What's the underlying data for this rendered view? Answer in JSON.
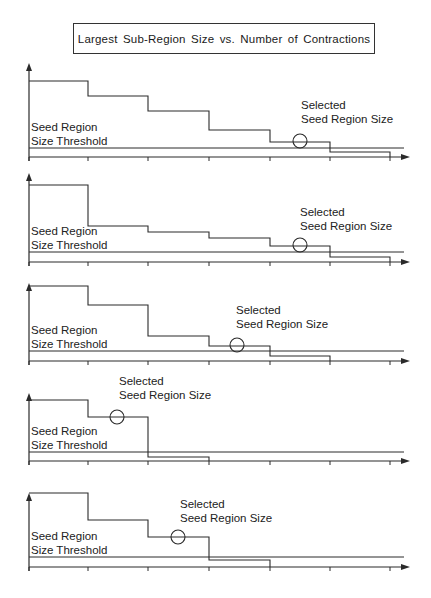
{
  "title": "Largest Sub-Region Size vs. Number of Contractions",
  "labels": {
    "threshold_line1": "Seed Region",
    "threshold_line2": "Size  Threshold",
    "selected_line1": "Selected",
    "selected_line2": "Seed Region Size"
  },
  "colors": {
    "line": "#2a2a2a",
    "background": "#ffffff"
  },
  "chart_data": {
    "type": "line",
    "title": "Largest Sub-Region Size vs. Number of Contractions",
    "xlabel": "Number of Contractions",
    "ylabel": "Largest Sub-Region Size",
    "x_ticks": [
      0,
      1,
      2,
      3,
      4,
      5,
      6
    ],
    "panels": [
      {
        "id": 1,
        "top": 60,
        "steps_y": [
          81,
          96,
          111,
          130,
          142,
          152
        ],
        "threshold_y": 148,
        "axis_y": 157,
        "selected_circle": {
          "x": 300,
          "y": 141
        },
        "selected_label": {
          "x": 301,
          "y": 122
        }
      },
      {
        "id": 2,
        "top": 170,
        "steps_y": [
          185,
          226,
          232,
          238,
          246,
          257
        ],
        "threshold_y": 252,
        "axis_y": 262,
        "selected_circle": {
          "x": 300,
          "y": 245
        },
        "selected_label": {
          "x": 300,
          "y": 229
        }
      },
      {
        "id": 3,
        "top": 280,
        "steps_y": [
          286,
          305,
          336,
          346,
          356
        ],
        "threshold_y": 351,
        "axis_y": 361,
        "selected_circle": {
          "x": 237,
          "y": 345
        },
        "selected_label": {
          "x": 236,
          "y": 327
        }
      },
      {
        "id": 4,
        "top": 390,
        "steps_y": [
          400,
          417,
          457
        ],
        "threshold_y": 452,
        "axis_y": 461,
        "selected_circle": {
          "x": 117,
          "y": 417
        },
        "selected_label": {
          "x": 119,
          "y": 398
        }
      },
      {
        "id": 5,
        "top": 490,
        "steps_y": [
          493,
          520,
          537,
          560
        ],
        "threshold_y": 557,
        "axis_y": 567,
        "selected_circle": {
          "x": 178,
          "y": 537
        },
        "selected_label": {
          "x": 180,
          "y": 521
        }
      }
    ]
  }
}
